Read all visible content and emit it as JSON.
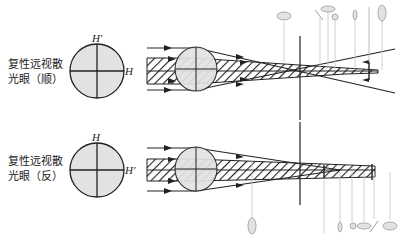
{
  "panels": [
    {
      "id": "with-the-rule",
      "label_line1": "复性远视散",
      "label_line2": "光眼（顺）",
      "meridian_vertical": "H'",
      "meridian_horizontal": "H"
    },
    {
      "id": "against-the-rule",
      "label_line1": "复性远视散",
      "label_line2": "光眼（反）",
      "meridian_vertical": "H",
      "meridian_horizontal": "H'"
    }
  ],
  "colors": {
    "line": "#222222",
    "fill": "#e2e2e2",
    "guide": "#bdbdbd"
  }
}
